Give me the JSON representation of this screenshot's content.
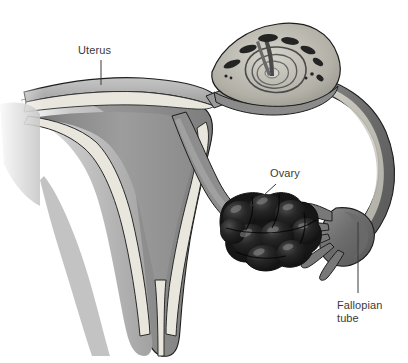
{
  "figure": {
    "background_color": "#ffffff",
    "width": 408,
    "height": 363,
    "style": "grayscale medical illustration"
  },
  "labels": [
    {
      "id": "uterus",
      "text": "Uterus",
      "x": 78,
      "y": 44,
      "leader": {
        "x1": 101,
        "y1": 60,
        "x2": 101,
        "y2": 83,
        "type": "straight-vertical"
      }
    },
    {
      "id": "ovary",
      "text": "Ovary",
      "x": 270,
      "y": 167,
      "leader": {
        "x1": 275,
        "y1": 184,
        "x2": 252,
        "y2": 205,
        "type": "straight-diagonal"
      }
    },
    {
      "id": "fallopian_tube",
      "text": "Fallopian\ntube",
      "line1": "Fallopian",
      "line2": "tube",
      "x": 337,
      "y": 299,
      "leader": {
        "x1": 358,
        "y1": 292,
        "x2": 358,
        "y2": 222,
        "type": "straight-vertical"
      }
    }
  ],
  "structures": [
    {
      "name": "uterus-body",
      "description": "Sectioned uterine corpus with endometrial cavity"
    },
    {
      "name": "endometrium",
      "description": "Light cream inner lining band"
    },
    {
      "name": "myometrium",
      "description": "Medium grey muscular wall"
    },
    {
      "name": "cervix",
      "description": "Narrow canal at the inferior uterus"
    },
    {
      "name": "fundus",
      "description": "Wavy banded superior uterine dome"
    },
    {
      "name": "ovarian-ligament",
      "description": "Narrow grey band from uterus to ovary"
    },
    {
      "name": "ovary",
      "description": "Dark lobulated cystic ovarian mass"
    },
    {
      "name": "fallopian-tube-arc",
      "description": "Curved tube sweeping right and down"
    },
    {
      "name": "ampulla-cross-section",
      "description": "Cut ampulla showing spiral mucosal plicae"
    },
    {
      "name": "fimbriae",
      "description": "Five finger-like projections at the infundibulum"
    }
  ],
  "colors": {
    "background": "#ffffff",
    "outline": "#1d1d1d",
    "cavity_gray": "#9a9a9a",
    "myometrium_gray": "#8e8e8e",
    "serosa_gray": "#b4b4b4",
    "endometrium_cream": "#e9e7dd",
    "tube_wall_dark": "#6f6f6f",
    "tube_lumen_light": "#d9d7cd",
    "ovary_dark": "#1b1b1b",
    "ovary_highlight": "#6a6a6a",
    "label_text": "#3a3a3a"
  }
}
